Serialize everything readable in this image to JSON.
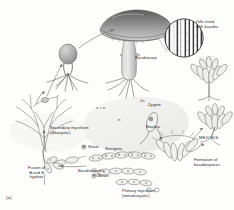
{
  "figure": {
    "panel_id": "(a)",
    "background": "#fdfdfc",
    "ink": "#6e6e6e"
  },
  "labels": {
    "gills": "Gills lined\nwith basidia",
    "basidiocarp": "Basidiocarp",
    "secondary_mycelium": "Secondary mycelium\n(dikaryotic)",
    "primary_mycelium": "Primary mycelium\n(monokaryotic)",
    "fusion": "Fusion of\n⊕ and ⊖\nhyphae",
    "strain_plus": "Strain",
    "strain_minus": "Strain",
    "strain_plus_sym": "⊕",
    "strain_minus_sym": "⊖",
    "zygote": "Zygote",
    "basidia": "Basidia",
    "sterigma": "Sterigma",
    "basidiospores": "Basidiospores",
    "meiosis": "MEIOSIS",
    "formation": "Formation of\nbasidiospores"
  },
  "ploidy": {
    "dikaryotic": "n + n",
    "diploid": "2n",
    "haploid": "n"
  },
  "diagram_data": {
    "type": "cycle-diagram",
    "organism": "Basidiomycota (club fungus)",
    "stages": [
      "Basidiospores",
      "Primary mycelium (monokaryotic, n)",
      "Fusion of + and - hyphae",
      "Secondary mycelium (dikaryotic, n + n)",
      "Basidiocarp",
      "Gills lined with basidia",
      "Zygote (2n)",
      "MEIOSIS",
      "Formation of basidiospores"
    ],
    "ploidy_regions": {
      "n + n": "secondary mycelium through basidium",
      "2n": "zygote nucleus in basidium",
      "n": "basidiospores and primary mycelium"
    },
    "mating_types": [
      "⊕",
      "⊖"
    ]
  }
}
